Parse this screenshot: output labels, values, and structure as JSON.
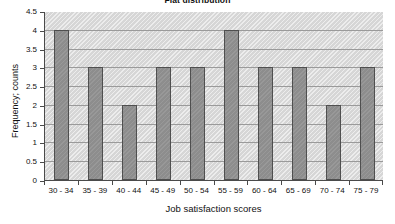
{
  "chart_data": {
    "type": "bar",
    "title": "Flat distribution",
    "xlabel": "Job satisfaction scores",
    "ylabel": "Frequency; counts",
    "categories": [
      "30 - 34",
      "35 - 39",
      "40 - 44",
      "45 - 49",
      "50 - 54",
      "55 - 59",
      "60 - 64",
      "65 - 69",
      "70 - 74",
      "75 - 79"
    ],
    "values": [
      4,
      3,
      2,
      3,
      3,
      4,
      3,
      3,
      2,
      3
    ],
    "ylim": [
      0,
      4.5
    ],
    "ytick_labels": [
      "0",
      "0.5",
      "1",
      "1.5",
      "2",
      "2.5",
      "3",
      "3.5",
      "4",
      "4.5"
    ],
    "ytick_values": [
      0,
      0.5,
      1,
      1.5,
      2,
      2.5,
      3,
      3.5,
      4,
      4.5
    ],
    "grid": true,
    "legend": false,
    "colors": {
      "bar_fill": "#8d8d8d",
      "bar_border": "#4f4f4f",
      "plot_background": "#d6d6d6",
      "gridline": "#9a9a9a",
      "axis": "#4a4a4a",
      "text": "#111111",
      "page_background": "#ffffff"
    }
  }
}
